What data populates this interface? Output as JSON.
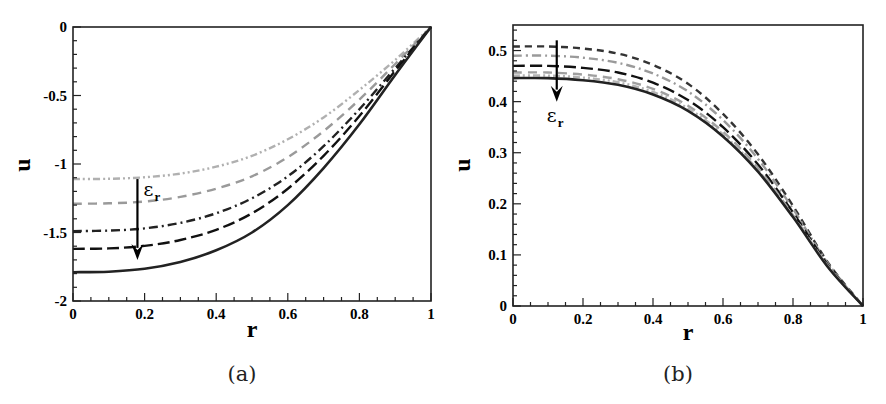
{
  "chart_data": [
    {
      "panel": "a",
      "type": "line",
      "caption": "(a)",
      "xlabel": "r",
      "ylabel": "u",
      "xlim": [
        0,
        1
      ],
      "ylim": [
        -2,
        0
      ],
      "xticks": [
        0,
        0.2,
        0.4,
        0.6,
        0.8,
        1
      ],
      "xtick_labels": [
        "0",
        "0.2",
        "0.4",
        "0.6",
        "0.8",
        "1"
      ],
      "yticks": [
        -2,
        -1.5,
        -1,
        -0.5,
        0
      ],
      "ytick_labels": [
        "-2",
        "-1.5",
        "-1",
        "-0.5",
        "0"
      ],
      "grid": false,
      "annotation": {
        "text": "ε",
        "subscript": "r",
        "arrow": "down",
        "x": 0.18,
        "y_from": -1.11,
        "y_to": -1.7
      },
      "x": [
        0,
        0.1,
        0.2,
        0.3,
        0.4,
        0.5,
        0.6,
        0.7,
        0.8,
        0.9,
        1.0
      ],
      "series": [
        {
          "name": "curve-1",
          "style": "dash-dot-dot",
          "color": "#b0b0b0",
          "values": [
            -1.11,
            -1.108,
            -1.097,
            -1.07,
            -1.02,
            -0.94,
            -0.82,
            -0.66,
            -0.46,
            -0.24,
            0
          ]
        },
        {
          "name": "curve-2",
          "style": "dash",
          "color": "#9a9a9a",
          "values": [
            -1.29,
            -1.287,
            -1.274,
            -1.24,
            -1.18,
            -1.09,
            -0.95,
            -0.76,
            -0.53,
            -0.27,
            0
          ]
        },
        {
          "name": "curve-3",
          "style": "dash-dot",
          "color": "#222222",
          "values": [
            -1.49,
            -1.486,
            -1.47,
            -1.43,
            -1.36,
            -1.25,
            -1.09,
            -0.87,
            -0.6,
            -0.3,
            0
          ]
        },
        {
          "name": "curve-4",
          "style": "long-dash",
          "color": "#111111",
          "values": [
            -1.62,
            -1.616,
            -1.598,
            -1.555,
            -1.48,
            -1.36,
            -1.18,
            -0.94,
            -0.65,
            -0.32,
            0
          ]
        },
        {
          "name": "curve-5",
          "style": "solid",
          "color": "#222222",
          "values": [
            -1.79,
            -1.786,
            -1.765,
            -1.715,
            -1.63,
            -1.5,
            -1.3,
            -1.03,
            -0.71,
            -0.35,
            0
          ]
        }
      ]
    },
    {
      "panel": "b",
      "type": "line",
      "caption": "(b)",
      "xlabel": "r",
      "ylabel": "u",
      "xlim": [
        0,
        1
      ],
      "ylim": [
        0,
        0.55
      ],
      "xticks": [
        0,
        0.2,
        0.4,
        0.6,
        0.8,
        1
      ],
      "xtick_labels": [
        "0",
        "0.2",
        "0.4",
        "0.6",
        "0.8",
        "1"
      ],
      "yticks": [
        0,
        0.1,
        0.2,
        0.3,
        0.4,
        0.5
      ],
      "ytick_labels": [
        "0",
        "0.1",
        "0.2",
        "0.3",
        "0.4",
        "0.5"
      ],
      "grid": false,
      "annotation": {
        "text": "ε",
        "subscript": "r",
        "arrow": "down",
        "x": 0.125,
        "y_from": 0.52,
        "y_to": 0.4
      },
      "x": [
        0,
        0.1,
        0.2,
        0.3,
        0.4,
        0.5,
        0.6,
        0.7,
        0.8,
        0.9,
        1.0
      ],
      "series": [
        {
          "name": "curve-1",
          "style": "short-dash",
          "color": "#333333",
          "values": [
            0.508,
            0.508,
            0.504,
            0.494,
            0.472,
            0.435,
            0.376,
            0.297,
            0.196,
            0.085,
            0
          ]
        },
        {
          "name": "curve-2",
          "style": "dash-dot",
          "color": "#9a9a9a",
          "values": [
            0.49,
            0.49,
            0.486,
            0.476,
            0.455,
            0.42,
            0.364,
            0.288,
            0.19,
            0.083,
            0
          ]
        },
        {
          "name": "curve-3",
          "style": "long-dash",
          "color": "#111111",
          "values": [
            0.47,
            0.47,
            0.466,
            0.457,
            0.437,
            0.403,
            0.35,
            0.277,
            0.183,
            0.08,
            0
          ]
        },
        {
          "name": "curve-4",
          "style": "dash",
          "color": "#a0a0a0",
          "values": [
            0.457,
            0.457,
            0.453,
            0.444,
            0.425,
            0.392,
            0.341,
            0.27,
            0.178,
            0.078,
            0
          ]
        },
        {
          "name": "curve-5",
          "style": "dash-dot-dot",
          "color": "#b5b5b5",
          "values": [
            0.451,
            0.451,
            0.447,
            0.438,
            0.419,
            0.387,
            0.336,
            0.266,
            0.176,
            0.077,
            0
          ]
        },
        {
          "name": "curve-6",
          "style": "solid",
          "color": "#222222",
          "values": [
            0.446,
            0.446,
            0.442,
            0.433,
            0.414,
            0.382,
            0.332,
            0.263,
            0.174,
            0.076,
            0
          ]
        }
      ]
    }
  ]
}
